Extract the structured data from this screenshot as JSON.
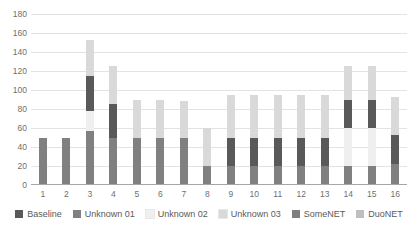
{
  "chart_data": {
    "type": "bar",
    "stacked": true,
    "title": "",
    "subtitle": "",
    "xlabel": "",
    "ylabel": "",
    "ylim": [
      0,
      180
    ],
    "ytick_step": 20,
    "yticks": [
      180,
      160,
      140,
      120,
      100,
      80,
      60,
      40,
      20,
      0
    ],
    "grid": true,
    "legend_position": "bottom",
    "categories": [
      "1",
      "2",
      "3",
      "4",
      "5",
      "6",
      "7",
      "8",
      "9",
      "10",
      "11",
      "12",
      "13",
      "14",
      "15",
      "16"
    ],
    "series": [
      {
        "name": "Baseline",
        "color": "#595959",
        "values": [
          0,
          0,
          37,
          35,
          0,
          0,
          0,
          0,
          30,
          30,
          30,
          30,
          30,
          30,
          30,
          31
        ]
      },
      {
        "name": "Unknown 01",
        "color": "#808080",
        "values": [
          50,
          50,
          57,
          50,
          50,
          50,
          50,
          20,
          20,
          20,
          20,
          20,
          20,
          20,
          20,
          22
        ]
      },
      {
        "name": "Unknown 02",
        "color": "#efefef",
        "values": [
          0,
          0,
          21,
          0,
          0,
          0,
          0,
          0,
          0,
          0,
          0,
          0,
          0,
          40,
          40,
          0
        ]
      },
      {
        "name": "Unknown 03",
        "color": "#d9d9d9",
        "values": [
          0,
          0,
          38,
          40,
          40,
          40,
          38,
          40,
          45,
          45,
          45,
          45,
          45,
          35,
          35,
          40
        ]
      },
      {
        "name": "SomeNET",
        "color": "#7f7f7f",
        "values": [
          0,
          0,
          0,
          0,
          0,
          0,
          0,
          0,
          0,
          0,
          0,
          0,
          0,
          0,
          0,
          0
        ]
      },
      {
        "name": "DuoNET",
        "color": "#bfbfbf",
        "values": [
          0,
          0,
          0,
          0,
          0,
          0,
          0,
          0,
          0,
          0,
          0,
          0,
          0,
          0,
          0,
          0
        ]
      }
    ],
    "bar_totals": [
      50,
      50,
      153,
      125,
      90,
      90,
      88,
      60,
      95,
      95,
      95,
      95,
      95,
      125,
      125,
      93
    ],
    "stack_order": [
      "Unknown 01",
      "Unknown 02",
      "Baseline",
      "Unknown 03"
    ]
  },
  "legend": {
    "items": [
      {
        "label": "Baseline",
        "color": "#595959"
      },
      {
        "label": "Unknown 01",
        "color": "#808080"
      },
      {
        "label": "Unknown 02",
        "color": "#efefef"
      },
      {
        "label": "Unknown 03",
        "color": "#d9d9d9"
      },
      {
        "label": "SomeNET",
        "color": "#7f7f7f"
      },
      {
        "label": "DuoNET",
        "color": "#bfbfbf"
      }
    ]
  }
}
